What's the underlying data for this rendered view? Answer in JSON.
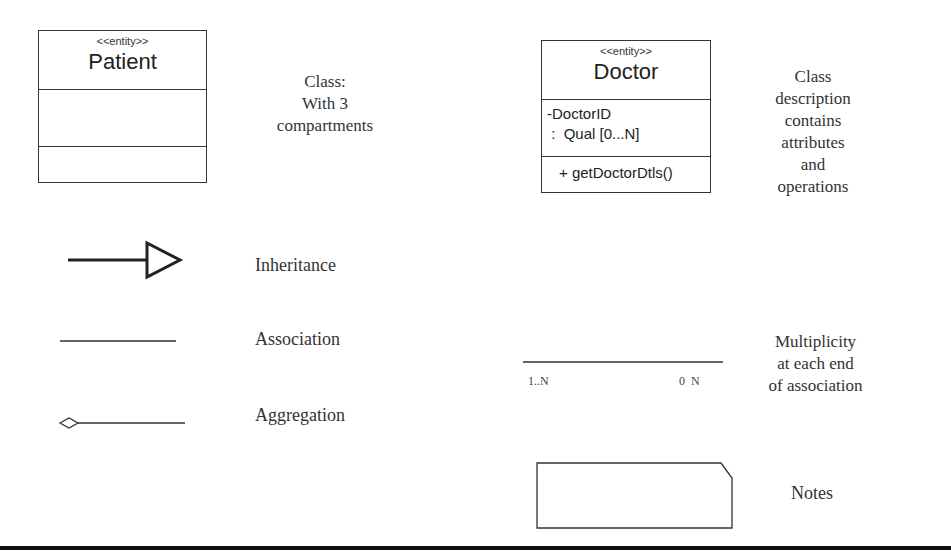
{
  "patient_class": {
    "stereotype": "<<entity>>",
    "name": "Patient",
    "attributes": [],
    "operations": []
  },
  "patient_description": {
    "lines": [
      "Class:",
      "With 3",
      "compartments"
    ]
  },
  "doctor_class": {
    "stereotype": "<<entity>>",
    "name": "Doctor",
    "attributes": [
      "-DoctorID",
      " :  Qual [0...N]"
    ],
    "operations": [
      "+ getDoctorDtls()"
    ]
  },
  "doctor_description": {
    "lines": [
      "Class",
      "description",
      "contains",
      "attributes",
      "and",
      "operations"
    ]
  },
  "legend": {
    "inheritance": "Inheritance",
    "association": "Association",
    "aggregation": "Aggregation",
    "notes": "Notes"
  },
  "multiplicity": {
    "left": "1..N",
    "right": "0  N",
    "description": [
      "Multiplicity",
      "at each end",
      "of association"
    ]
  },
  "colors": {
    "stroke": "#333333",
    "text": "#222222",
    "background": "#ffffff"
  }
}
